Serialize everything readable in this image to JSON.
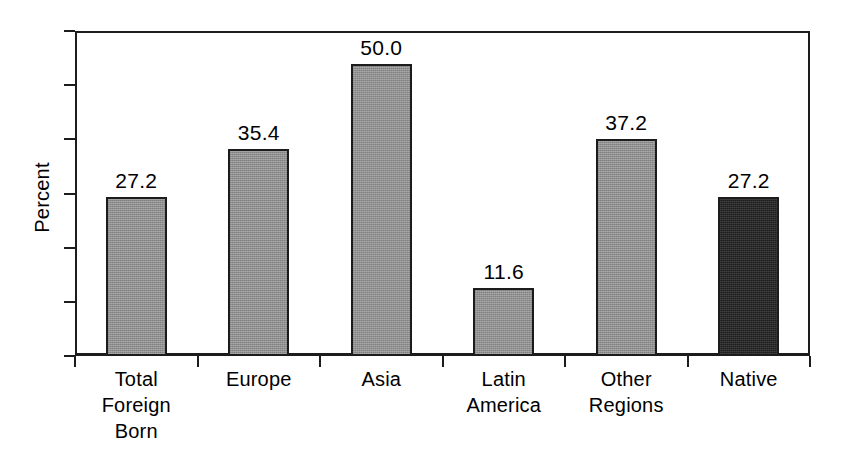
{
  "chart_data": {
    "type": "bar",
    "title": "",
    "subtitle": "",
    "xlabel": "",
    "ylabel": "Percent",
    "categories": [
      "Total Foreign Born",
      "Europe",
      "Asia",
      "Latin America",
      "Other Regions",
      "Native"
    ],
    "category_lines": [
      [
        "Total",
        "Foreign",
        "Born"
      ],
      [
        "Europe"
      ],
      [
        "Asia"
      ],
      [
        "Latin",
        "America"
      ],
      [
        "Other",
        "Regions"
      ],
      [
        "Native"
      ]
    ],
    "values": [
      27.2,
      35.4,
      50.0,
      11.6,
      37.2,
      27.2
    ],
    "value_labels": [
      "27.2",
      "35.4",
      "50.0",
      "11.6",
      "37.2",
      "27.2"
    ],
    "bar_colors": [
      "#8f8f8f",
      "#8f8f8f",
      "#8f8f8f",
      "#8f8f8f",
      "#8f8f8f",
      "#1d1d1d"
    ],
    "bar_styles": [
      "gray",
      "gray",
      "gray",
      "gray",
      "gray",
      "dark"
    ],
    "ylim": [
      0,
      55.6
    ],
    "y_tick_count": 7,
    "y_tick_labels": [
      "",
      "",
      "",
      "",
      "",
      "",
      ""
    ],
    "grid": false,
    "legend": null,
    "frame_color": "#1c1c1c",
    "background": "#ffffff"
  },
  "axis": {
    "y_title": "Percent"
  }
}
